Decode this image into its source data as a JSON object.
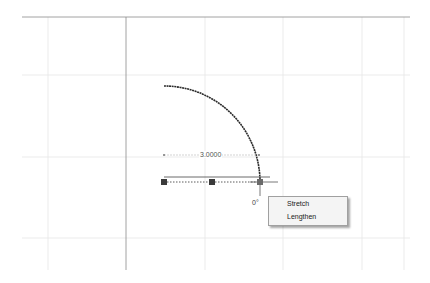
{
  "drawing": {
    "grid_color": "#e3e3e3",
    "axis_color": "#8a8a8a",
    "arc_color": "#2a2a2a",
    "dimension_label": "3.0000",
    "angle_label": "0°",
    "grips": [
      "start-grip",
      "mid-grip",
      "end-grip"
    ]
  },
  "context_menu": {
    "items": [
      {
        "label": "Stretch"
      },
      {
        "label": "Lengthen"
      }
    ]
  }
}
